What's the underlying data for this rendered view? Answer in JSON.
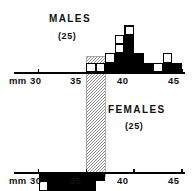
{
  "chart_data": {
    "type": "bar",
    "title": "",
    "subtitle": "",
    "xlabel": "mm",
    "ylabel": "",
    "orientation": "back-to-back paired histogram (mirrored)",
    "unit_note": "each square = 1 individual",
    "xlim": [
      29,
      46
    ],
    "bin_width": 1,
    "axis_unit_label": "mm",
    "tick_labels": [
      "30",
      "35",
      "40",
      "45"
    ],
    "tick_values": [
      30,
      35,
      40,
      45
    ],
    "groups": [
      {
        "name": "MALES",
        "label": "MALES",
        "count_label": "(25)",
        "n": 25,
        "direction": "up",
        "categories": [
          30,
          31,
          32,
          33,
          34,
          35,
          36,
          37,
          38,
          39,
          40,
          41,
          42,
          43,
          44
        ],
        "values": [
          0,
          0,
          0,
          0,
          0,
          1,
          1,
          2,
          4,
          5,
          2,
          1,
          1,
          2,
          1
        ],
        "filled_values": [
          0,
          0,
          0,
          0,
          0,
          0,
          0,
          1,
          2,
          4,
          2,
          1,
          0,
          1,
          1
        ],
        "open_values": [
          0,
          0,
          0,
          0,
          0,
          1,
          1,
          1,
          2,
          1,
          0,
          0,
          1,
          1,
          0
        ]
      },
      {
        "name": "FEMALES",
        "label": "FEMALES",
        "count_label": "(25)",
        "n": 25,
        "direction": "down",
        "categories": [
          30,
          31,
          32,
          33,
          34,
          35,
          36,
          37,
          38,
          39,
          40,
          41,
          42,
          43,
          44
        ],
        "values": [
          2,
          3,
          4,
          5,
          5,
          5,
          1,
          0,
          0,
          0,
          0,
          0,
          0,
          0,
          0
        ],
        "filled_values": [
          1,
          3,
          3,
          5,
          4,
          4,
          1,
          0,
          0,
          0,
          0,
          0,
          0,
          0,
          0
        ],
        "open_values": [
          1,
          0,
          1,
          0,
          1,
          1,
          0,
          0,
          0,
          0,
          0,
          0,
          0,
          0,
          0
        ]
      }
    ],
    "overlap_band": {
      "label": "zone of overlap",
      "from": 35,
      "to": 37,
      "pattern": "stipple"
    },
    "colors": {
      "filled": "#000000",
      "open": "#ffffff",
      "outline": "#000000",
      "stipple": "#9a9a9a",
      "axis": "#000000",
      "text": "#111111"
    },
    "grid": false,
    "legend": "none"
  },
  "labels": {
    "males_title": "MALES",
    "males_count": "(25)",
    "females_title": "FEMALES",
    "females_count": "(25)",
    "unit_top": "mm",
    "unit_bottom": "mm",
    "top_ticks": [
      "30",
      "35",
      "40",
      "45"
    ],
    "bottom_ticks": [
      "30",
      "35",
      "40",
      "45"
    ]
  }
}
